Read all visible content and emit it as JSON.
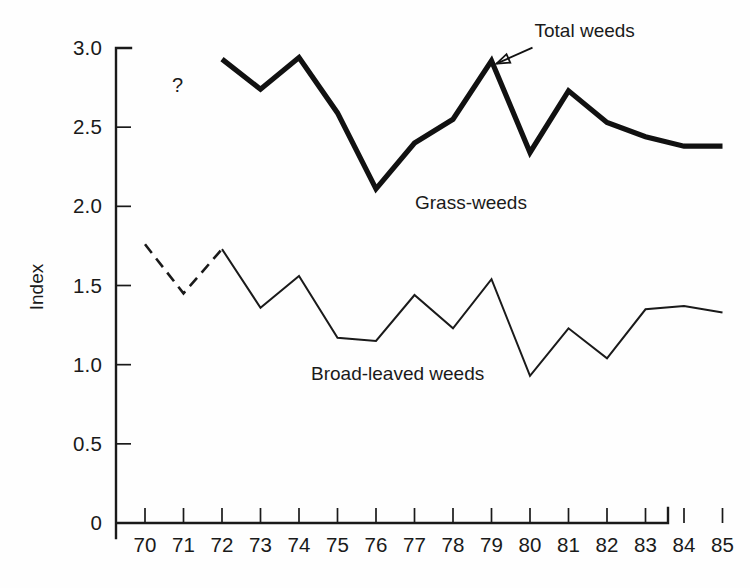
{
  "chart_data": {
    "type": "line",
    "title": "",
    "xlabel": "",
    "ylabel": "Index",
    "x": [
      70,
      71,
      72,
      73,
      74,
      75,
      76,
      77,
      78,
      79,
      80,
      81,
      82,
      83,
      84,
      85
    ],
    "categories": [
      "70",
      "71",
      "72",
      "73",
      "74",
      "75",
      "76",
      "77",
      "78",
      "79",
      "80",
      "81",
      "82",
      "83",
      "84",
      "85"
    ],
    "xlim": [
      69.5,
      85.3
    ],
    "ylim": [
      0,
      3.0
    ],
    "yticks": [
      "0",
      "0.5",
      "1.0",
      "1.5",
      "2.0",
      "2.5",
      "3.0"
    ],
    "ytick_values": [
      0,
      0.5,
      1.0,
      1.5,
      2.0,
      2.5,
      3.0
    ],
    "grid": false,
    "legend_position": "inline-annotations",
    "series": [
      {
        "name": "Total weeds",
        "style": "thick-solid",
        "color": "#111111",
        "x": [
          72,
          73,
          74,
          75,
          76,
          77,
          78,
          79,
          80,
          81,
          82,
          83,
          84,
          85
        ],
        "values": [
          2.93,
          2.74,
          2.94,
          2.59,
          2.11,
          2.4,
          2.55,
          2.92,
          2.34,
          2.73,
          2.53,
          2.44,
          2.38,
          2.38
        ]
      },
      {
        "name": "Broad-leaved weeds",
        "style": "thin-solid-with-dashed-start",
        "color": "#1a1a1a",
        "x": [
          70,
          71,
          72,
          73,
          74,
          75,
          76,
          77,
          78,
          79,
          80,
          81,
          82,
          83,
          84,
          85
        ],
        "values": [
          1.76,
          1.45,
          1.73,
          1.36,
          1.56,
          1.17,
          1.15,
          1.44,
          1.23,
          1.54,
          0.93,
          1.23,
          1.04,
          1.35,
          1.37,
          1.33
        ],
        "dashed_segment_x": [
          70,
          71,
          72
        ]
      }
    ],
    "annotations": [
      {
        "name": "total-weeds-callout",
        "text": "Total weeds",
        "points_to_x": 79,
        "points_to_y": 2.92
      },
      {
        "name": "grass-weeds-label",
        "text": "Grass-weeds",
        "at_x": 77.0,
        "at_y": 2.03
      },
      {
        "name": "broad-leaved-label",
        "text": "Broad-leaved weeds",
        "at_x": 74.3,
        "at_y": 0.95
      },
      {
        "name": "uncertainty-marker",
        "text": "?",
        "at_x": 70.7,
        "at_y": 2.77
      }
    ]
  }
}
